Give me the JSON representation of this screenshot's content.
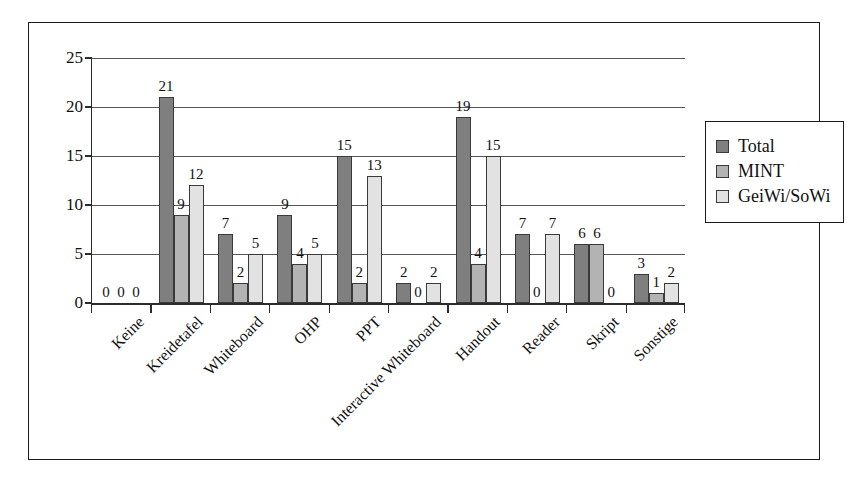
{
  "chart_data": {
    "type": "bar",
    "title": "",
    "xlabel": "",
    "ylabel": "",
    "ylim": [
      0,
      25
    ],
    "yticks": [
      0,
      5,
      10,
      15,
      20,
      25
    ],
    "grid": true,
    "legend_position": "right",
    "categories": [
      "Keine",
      "Kreidetafel",
      "Whiteboard",
      "OHP",
      "PPT",
      "Interactive Whiteboard",
      "Handout",
      "Reader",
      "Skript",
      "Sonstige"
    ],
    "series": [
      {
        "name": "Total",
        "color": "#7f7f7f",
        "values": [
          0,
          21,
          7,
          9,
          15,
          2,
          19,
          7,
          6,
          3
        ]
      },
      {
        "name": "MINT",
        "color": "#b3b3b3",
        "values": [
          0,
          9,
          2,
          4,
          2,
          0,
          4,
          0,
          6,
          1
        ]
      },
      {
        "name": "GeiWi/SoWi",
        "color": "#e2e2e2",
        "values": [
          0,
          12,
          5,
          5,
          13,
          2,
          15,
          7,
          0,
          2
        ]
      }
    ]
  }
}
